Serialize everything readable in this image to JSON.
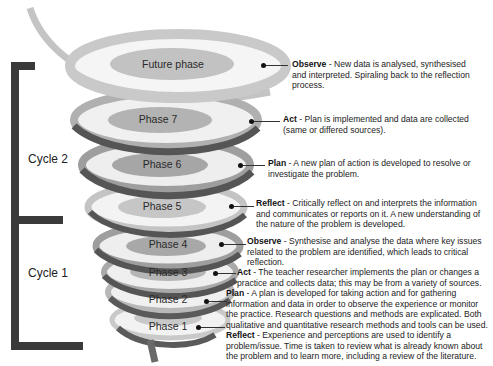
{
  "diagram": {
    "type": "action-research-spiral",
    "colors": {
      "ring_light": "#c9c9c9",
      "ring_mid": "#9e9e9e",
      "ring_dark": "#5a5a5a",
      "phase_fill": "#b3b3b3",
      "bracket": "#3a3a3a"
    },
    "cycles": [
      {
        "label": "Cycle 2"
      },
      {
        "label": "Cycle 1"
      }
    ],
    "phases": [
      {
        "label": "Future phase"
      },
      {
        "label": "Phase 7"
      },
      {
        "label": "Phase 6"
      },
      {
        "label": "Phase 5"
      },
      {
        "label": "Phase 4"
      },
      {
        "label": "Phase 3"
      },
      {
        "label": "Phase 2"
      },
      {
        "label": "Phase 1"
      }
    ],
    "descriptions": [
      {
        "term": "Observe",
        "text": " - New data is analysed, synthesised and interpreted. Spiraling back to the reflection process."
      },
      {
        "term": "Act",
        "text": " - Plan is implemented and data are collected (same or differed sources)."
      },
      {
        "term": "Plan",
        "text": " - A new plan of action is developed to resolve or investigate the problem."
      },
      {
        "term": "Reflect",
        "text": " - Critically reflect on and interprets the information and communicates or reports on it. A new understanding of the nature of the problem is developed."
      },
      {
        "term": "Observe",
        "text": " - Synthesise and analyse the data where key issues related to the problem are identified, which leads to critical reflection."
      },
      {
        "term": "Act",
        "text": " - The teacher researcher implements the plan or changes a practice and collects data; this may be from a variety of sources."
      },
      {
        "term": "Plan",
        "text": " - A plan is developed for taking action and for gathering information and data in order to observe the experience or monitor the practice. Research questions and methods are explicated. Both qualitative and quantitative research methods and tools can be used."
      },
      {
        "term": "Reflect",
        "text": " - Experience and perceptions are used to identify a problem/issue. Time is taken to review what is already known about the problem and to learn more, including a review of the literature."
      }
    ]
  }
}
